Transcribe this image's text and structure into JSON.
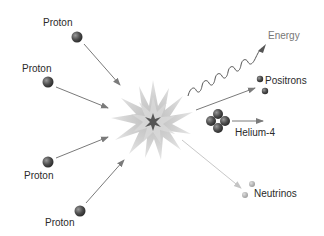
{
  "diagram": {
    "inputs": [
      {
        "label": "Proton"
      },
      {
        "label": "Proton"
      },
      {
        "label": "Proton"
      },
      {
        "label": "Proton"
      }
    ],
    "center": {
      "name": "fusion-burst"
    },
    "outputs": [
      {
        "label": "Energy",
        "kind": "wave"
      },
      {
        "label": "Positrons",
        "kind": "particles",
        "count": 2
      },
      {
        "label": "Helium-4",
        "kind": "nucleus",
        "count": 4
      },
      {
        "label": "Neutrinos",
        "kind": "particles",
        "count": 2
      }
    ],
    "colors": {
      "particle": "#555555",
      "arrow": "#888888",
      "burst_outer": "#d4d4d4",
      "burst_inner": "#5a5a5a",
      "neutrino": "#b0b0b0",
      "neutrino_arrow": "#c8c8c8"
    }
  }
}
